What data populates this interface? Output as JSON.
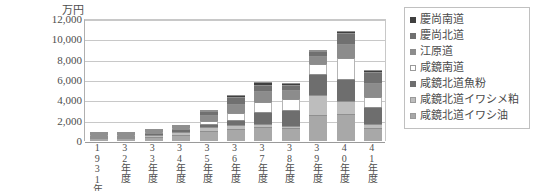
{
  "chart_data": {
    "type": "bar",
    "stacked": true,
    "title": "",
    "subtitle": "",
    "xlabel": "",
    "ylabel": "万円",
    "ylim": [
      0,
      12000
    ],
    "ytick_step": 2000,
    "ytick_labels": [
      "12,000",
      "10,000",
      "8,000",
      "6,000",
      "4,000",
      "2,000",
      "0"
    ],
    "ytick_values": [
      12000,
      10000,
      8000,
      6000,
      4000,
      2000,
      0
    ],
    "grid": true,
    "legend_position": "right",
    "categories": [
      "1931年度",
      "32年度",
      "33年度",
      "34年度",
      "35年度",
      "36年度",
      "37年度",
      "38年度",
      "39年度",
      "40年度",
      "41年度"
    ],
    "series": [
      {
        "name": "咸鏡北道イワシ油",
        "color": "#a8a8a8",
        "values": [
          260,
          300,
          420,
          560,
          950,
          1200,
          1350,
          1250,
          2600,
          2650,
          1250
        ]
      },
      {
        "name": "咸鏡北道イワシメ粕",
        "color": "#bdbdbd",
        "values": [
          110,
          120,
          180,
          290,
          420,
          420,
          300,
          200,
          1900,
          1300,
          400
        ]
      },
      {
        "name": "咸鏡北道魚粉",
        "color": "#6e6e6e",
        "values": [
          90,
          90,
          150,
          300,
          320,
          400,
          1200,
          1650,
          2050,
          2200,
          1700
        ]
      },
      {
        "name": "咸鏡南道",
        "color": "#ffffff",
        "values": [
          60,
          60,
          100,
          130,
          310,
          700,
          1000,
          1000,
          1000,
          2000,
          1000
        ]
      },
      {
        "name": "江原道",
        "color": "#8c8c8c",
        "values": [
          40,
          40,
          70,
          110,
          600,
          900,
          1100,
          950,
          800,
          1400,
          1350
        ]
      },
      {
        "name": "慶尚北道",
        "color": "#707070",
        "values": [
          30,
          30,
          50,
          80,
          350,
          750,
          600,
          500,
          550,
          1100,
          1100
        ]
      },
      {
        "name": "慶尚南道",
        "color": "#3f3f3f",
        "values": [
          20,
          20,
          30,
          50,
          150,
          200,
          250,
          200,
          100,
          150,
          200
        ]
      }
    ],
    "totals": [
      610,
      660,
      1000,
      1520,
      3100,
      4570,
      5800,
      5750,
      9000,
      10800,
      7000
    ]
  },
  "legend": {
    "items": [
      {
        "label": "慶尚南道",
        "color": "#3f3f3f",
        "border": "#3f3f3f"
      },
      {
        "label": "慶尚北道",
        "color": "#707070",
        "border": "#707070"
      },
      {
        "label": "江原道",
        "color": "#8c8c8c",
        "border": "#8c8c8c"
      },
      {
        "label": "咸鏡南道",
        "color": "#ffffff",
        "border": "#9a9a9a"
      },
      {
        "label": "咸鏡北道魚粉",
        "color": "#6e6e6e",
        "border": "#6e6e6e"
      },
      {
        "label": "咸鏡北道イワシメ粕",
        "color": "#bdbdbd",
        "border": "#9a9a9a"
      },
      {
        "label": "咸鏡北道イワシ油",
        "color": "#a8a8a8",
        "border": "#9a9a9a"
      }
    ]
  }
}
